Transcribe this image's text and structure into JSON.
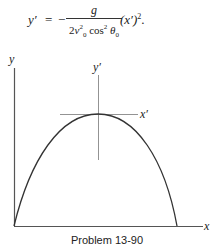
{
  "equation": {
    "lhs": "y′",
    "equals": "=",
    "sign": "−",
    "numerator": "g",
    "denominator": {
      "coef": "2",
      "v": "v",
      "v_sub": "0",
      "v_sup": "2",
      "cos": "cos",
      "cos_sup": "2",
      "theta": "θ",
      "theta_sub": "0"
    },
    "rhs": "(x′)",
    "rhs_sup": "2",
    "trailing": "."
  },
  "figure": {
    "axis_labels": {
      "y": "y",
      "x": "x",
      "y_prime": "y′",
      "x_prime": "x′"
    },
    "curve": "parabolic trajectory",
    "colors": {
      "line": "#333333",
      "axis": "#555555"
    }
  },
  "caption": "Problem 13-90"
}
